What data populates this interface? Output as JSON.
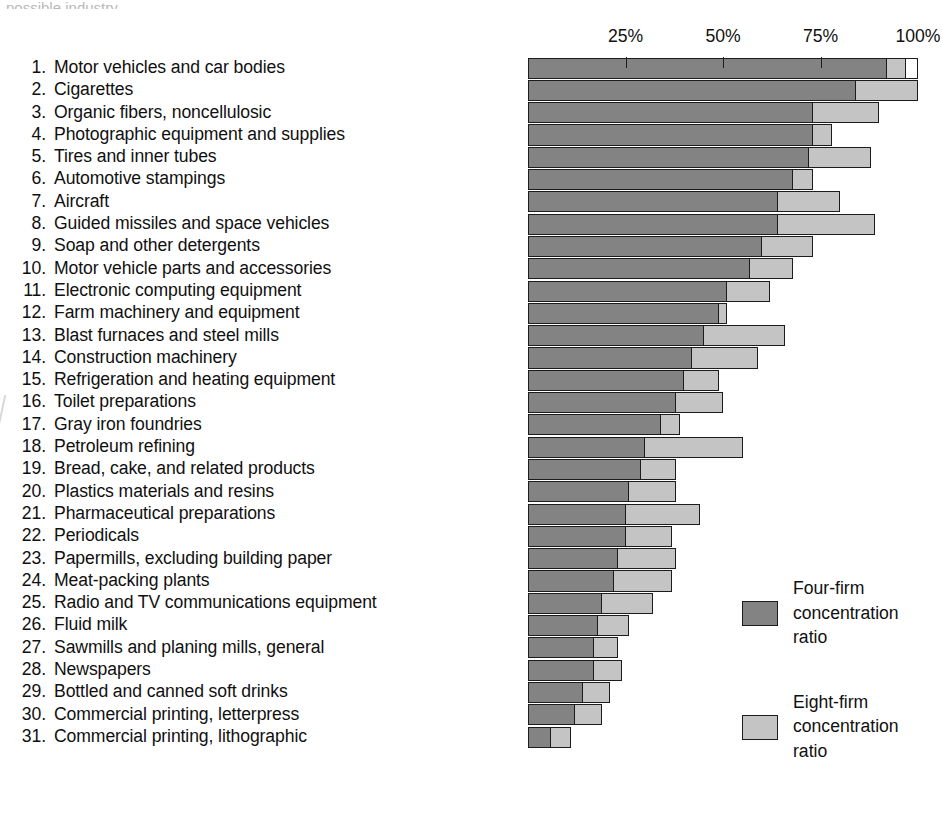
{
  "page": {
    "top_remnant_text": "possible industry"
  },
  "axis": {
    "ticks": [
      {
        "label": "25%",
        "value": 25
      },
      {
        "label": "50%",
        "value": 50
      },
      {
        "label": "75%",
        "value": 75
      },
      {
        "label": "100%",
        "value": 100
      }
    ]
  },
  "legend": {
    "entries": [
      {
        "name": "four-firm",
        "label": "Four-firm\nconcentration\nratio",
        "color": "#838383"
      },
      {
        "name": "eight-firm",
        "label": "Eight-firm\nconcentration\nratio",
        "color": "#c4c4c4"
      }
    ]
  },
  "chart_data": {
    "type": "bar",
    "orientation": "horizontal",
    "stacked_overlay": true,
    "title": "",
    "xlabel": "",
    "ylabel": "",
    "xlim": [
      0,
      100
    ],
    "grid": false,
    "legend_position": "right",
    "tick_labels": [
      "25%",
      "50%",
      "75%",
      "100%"
    ],
    "series": [
      {
        "name": "Four-firm concentration ratio",
        "color": "#838383"
      },
      {
        "name": "Eight-firm concentration ratio",
        "color": "#c4c4c4"
      }
    ],
    "categories": [
      "Motor vehicles and car bodies",
      "Cigarettes",
      "Organic fibers, noncellulosic",
      "Photographic equipment and supplies",
      "Tires and inner tubes",
      "Automotive stampings",
      "Aircraft",
      "Guided missiles and space vehicles",
      "Soap and other detergents",
      "Motor vehicle parts and accessories",
      "Electronic computing equipment",
      "Farm machinery and equipment",
      "Blast furnaces and steel mills",
      "Construction machinery",
      "Refrigeration and heating equipment",
      "Toilet preparations",
      "Gray iron foundries",
      "Petroleum refining",
      "Bread, cake, and related products",
      "Plastics materials and resins",
      "Pharmaceutical preparations",
      "Periodicals",
      "Papermills, excluding building paper",
      "Meat-packing plants",
      "Radio and TV communications equipment",
      "Fluid milk",
      "Sawmills and planing mills, general",
      "Newspapers",
      "Bottled and canned soft drinks",
      "Commercial printing, letterpress",
      "Commercial printing, lithographic"
    ],
    "rows": [
      {
        "rank": 1,
        "industry": "Motor vehicles and car bodies",
        "four_firm": 92,
        "eight_firm": 97,
        "outline_to": 100
      },
      {
        "rank": 2,
        "industry": "Cigarettes",
        "four_firm": 84,
        "eight_firm": 100,
        "outline_to": null
      },
      {
        "rank": 3,
        "industry": "Organic fibers, noncellulosic",
        "four_firm": 73,
        "eight_firm": 90,
        "outline_to": null
      },
      {
        "rank": 4,
        "industry": "Photographic equipment and supplies",
        "four_firm": 73,
        "eight_firm": 78,
        "outline_to": null
      },
      {
        "rank": 5,
        "industry": "Tires and inner tubes",
        "four_firm": 72,
        "eight_firm": 88,
        "outline_to": null
      },
      {
        "rank": 6,
        "industry": "Automotive stampings",
        "four_firm": 68,
        "eight_firm": 73,
        "outline_to": null
      },
      {
        "rank": 7,
        "industry": "Aircraft",
        "four_firm": 64,
        "eight_firm": 80,
        "outline_to": null
      },
      {
        "rank": 8,
        "industry": "Guided missiles and space vehicles",
        "four_firm": 64,
        "eight_firm": 89,
        "outline_to": null
      },
      {
        "rank": 9,
        "industry": "Soap and other detergents",
        "four_firm": 60,
        "eight_firm": 73,
        "outline_to": null
      },
      {
        "rank": 10,
        "industry": "Motor vehicle parts and accessories",
        "four_firm": 57,
        "eight_firm": 68,
        "outline_to": null
      },
      {
        "rank": 11,
        "industry": "Electronic computing equipment",
        "four_firm": 51,
        "eight_firm": 62,
        "outline_to": null
      },
      {
        "rank": 12,
        "industry": "Farm machinery and equipment",
        "four_firm": 49,
        "eight_firm": 51,
        "outline_to": null
      },
      {
        "rank": 13,
        "industry": "Blast furnaces and steel mills",
        "four_firm": 45,
        "eight_firm": 66,
        "outline_to": null
      },
      {
        "rank": 14,
        "industry": "Construction machinery",
        "four_firm": 42,
        "eight_firm": 59,
        "outline_to": null
      },
      {
        "rank": 15,
        "industry": "Refrigeration and heating equipment",
        "four_firm": 40,
        "eight_firm": 49,
        "outline_to": null
      },
      {
        "rank": 16,
        "industry": "Toilet preparations",
        "four_firm": 38,
        "eight_firm": 50,
        "outline_to": null
      },
      {
        "rank": 17,
        "industry": "Gray iron foundries",
        "four_firm": 34,
        "eight_firm": 39,
        "outline_to": null
      },
      {
        "rank": 18,
        "industry": "Petroleum refining",
        "four_firm": 30,
        "eight_firm": 55,
        "outline_to": null
      },
      {
        "rank": 19,
        "industry": "Bread, cake, and related products",
        "four_firm": 29,
        "eight_firm": 38,
        "outline_to": null
      },
      {
        "rank": 20,
        "industry": "Plastics materials and resins",
        "four_firm": 26,
        "eight_firm": 38,
        "outline_to": null
      },
      {
        "rank": 21,
        "industry": "Pharmaceutical preparations",
        "four_firm": 25,
        "eight_firm": 44,
        "outline_to": null
      },
      {
        "rank": 22,
        "industry": "Periodicals",
        "four_firm": 25,
        "eight_firm": 37,
        "outline_to": null
      },
      {
        "rank": 23,
        "industry": "Papermills, excluding building paper",
        "four_firm": 23,
        "eight_firm": 38,
        "outline_to": null
      },
      {
        "rank": 24,
        "industry": "Meat-packing plants",
        "four_firm": 22,
        "eight_firm": 37,
        "outline_to": null
      },
      {
        "rank": 25,
        "industry": "Radio and TV communications equipment",
        "four_firm": 19,
        "eight_firm": 32,
        "outline_to": null
      },
      {
        "rank": 26,
        "industry": "Fluid milk",
        "four_firm": 18,
        "eight_firm": 26,
        "outline_to": null
      },
      {
        "rank": 27,
        "industry": "Sawmills and planing mills, general",
        "four_firm": 17,
        "eight_firm": 23,
        "outline_to": null
      },
      {
        "rank": 28,
        "industry": "Newspapers",
        "four_firm": 17,
        "eight_firm": 24,
        "outline_to": null
      },
      {
        "rank": 29,
        "industry": "Bottled and canned soft drinks",
        "four_firm": 14,
        "eight_firm": 21,
        "outline_to": null
      },
      {
        "rank": 30,
        "industry": "Commercial printing, letterpress",
        "four_firm": 12,
        "eight_firm": 19,
        "outline_to": null
      },
      {
        "rank": 31,
        "industry": "Commercial printing, lithographic",
        "four_firm": 6,
        "eight_firm": 11,
        "outline_to": null
      }
    ]
  }
}
